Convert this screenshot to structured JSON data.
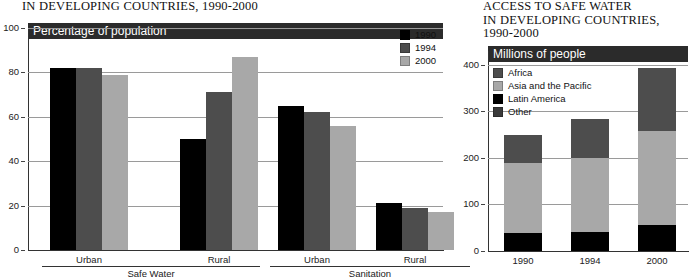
{
  "left": {
    "title": "IN DEVELOPING COUNTRIES, 1990-2000",
    "banner": "Percentage of population",
    "legend": [
      {
        "label": "1990",
        "color": "#000000"
      },
      {
        "label": "1994",
        "color": "#4d4d4d"
      },
      {
        "label": "2000",
        "color": "#a8a8a8"
      }
    ],
    "group_labels": [
      "Safe Water",
      "Sanitation"
    ],
    "sub_labels": [
      "Urban",
      "Rural",
      "Urban",
      "Rural"
    ]
  },
  "right": {
    "title_lines": [
      "ACCESS TO SAFE WATER",
      "IN DEVELOPING COUNTRIES,",
      "1990-2000"
    ],
    "banner": "Millions of people",
    "legend": [
      {
        "label": "Africa",
        "color": "#4d4d4d"
      },
      {
        "label": "Asia and the Pacific",
        "color": "#a8a8a8"
      },
      {
        "label": "Latin America",
        "color": "#000000"
      },
      {
        "label": "Other",
        "color": "#3a3a3a"
      }
    ]
  },
  "chart_data": [
    {
      "type": "bar",
      "title": "IN DEVELOPING COUNTRIES, 1990-2000",
      "subtitle": "Percentage of population",
      "xlabel": "",
      "ylabel": "Percentage of population",
      "ylim": [
        0,
        100
      ],
      "yticks": [
        0,
        20,
        40,
        60,
        80,
        100
      ],
      "ytick_labels": [
        "0",
        "20",
        "40",
        "60",
        "80",
        "100"
      ],
      "grid": true,
      "legend_position": "top-right",
      "categories": [
        "Safe Water / Urban",
        "Safe Water / Rural",
        "Sanitation / Urban",
        "Sanitation / Rural"
      ],
      "groups": [
        {
          "name": "Safe Water",
          "subcategories": [
            "Urban",
            "Rural"
          ]
        },
        {
          "name": "Sanitation",
          "subcategories": [
            "Urban",
            "Rural"
          ]
        }
      ],
      "series": [
        {
          "name": "1990",
          "color": "#000000",
          "values": [
            82,
            50,
            65,
            21
          ]
        },
        {
          "name": "1994",
          "color": "#4d4d4d",
          "values": [
            82,
            71,
            62,
            19
          ]
        },
        {
          "name": "2000",
          "color": "#a8a8a8",
          "values": [
            79,
            87,
            56,
            17
          ]
        }
      ]
    },
    {
      "type": "bar",
      "stacked": true,
      "title": "ACCESS TO SAFE WATER IN DEVELOPING COUNTRIES, 1990-2000",
      "subtitle": "Millions of people",
      "xlabel": "",
      "ylabel": "Millions of people",
      "ylim": [
        0,
        430
      ],
      "yticks": [
        0,
        100,
        200,
        300,
        400
      ],
      "ytick_labels": [
        "0",
        "100",
        "200",
        "300",
        "400"
      ],
      "grid": true,
      "legend_position": "top-left",
      "categories": [
        "1990",
        "1994",
        "2000"
      ],
      "series": [
        {
          "name": "Latin America",
          "color": "#000000",
          "values": [
            38,
            40,
            57
          ]
        },
        {
          "name": "Asia and the Pacific",
          "color": "#a8a8a8",
          "values": [
            151,
            160,
            200
          ]
        },
        {
          "name": "Other",
          "color": "#4d4d4d",
          "values": [
            61,
            83,
            136
          ]
        }
      ],
      "totals": [
        250,
        283,
        393
      ]
    }
  ]
}
